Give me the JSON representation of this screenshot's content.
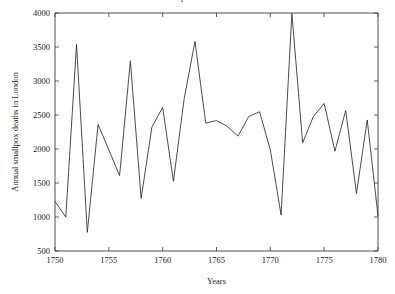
{
  "figure": {
    "title_clipped": "Annual smallpox deaths in London",
    "background": "#ffffff",
    "line_color": "#2b2b2b",
    "axis_color": "#3a3a3a"
  },
  "chart_data": {
    "type": "line",
    "title": "",
    "xlabel": "Years",
    "ylabel": "Annual smallpox deaths in London",
    "xlim": [
      1750,
      1780
    ],
    "ylim": [
      500,
      4000
    ],
    "xticks": [
      1750,
      1755,
      1760,
      1765,
      1770,
      1775,
      1780
    ],
    "xticklabels": [
      "1750",
      "1755",
      "1760",
      "1765",
      "1770",
      "1775",
      "1780"
    ],
    "yticks": [
      500,
      1000,
      1500,
      2000,
      2500,
      3000,
      3500,
      4000
    ],
    "yticklabels": [
      "500",
      "1000",
      "1500",
      "2000",
      "2500",
      "3000",
      "3500",
      "4000"
    ],
    "grid": false,
    "legend": false,
    "legend_position": "none",
    "x": [
      1750,
      1751,
      1752,
      1753,
      1754,
      1755,
      1756,
      1757,
      1758,
      1759,
      1760,
      1761,
      1762,
      1763,
      1764,
      1765,
      1766,
      1767,
      1768,
      1769,
      1770,
      1771,
      1772,
      1773,
      1774,
      1775,
      1776,
      1777,
      1778,
      1779,
      1780
    ],
    "values": [
      1229,
      998,
      3538,
      774,
      2360,
      1988,
      1608,
      3296,
      1273,
      2322,
      2612,
      1525,
      2743,
      3582,
      2382,
      2418,
      2334,
      2189,
      2479,
      2548,
      1986,
      1028,
      3992,
      2091,
      2479,
      2669,
      1968,
      2567,
      1346,
      2427,
      1015
    ],
    "series": [
      {
        "name": "Smallpox deaths",
        "values": [
          1229,
          998,
          3538,
          774,
          2360,
          1988,
          1608,
          3296,
          1273,
          2322,
          2612,
          1525,
          2743,
          3582,
          2382,
          2418,
          2334,
          2189,
          2479,
          2548,
          1986,
          1028,
          3992,
          2091,
          2479,
          2669,
          1968,
          2567,
          1346,
          2427,
          1015
        ]
      }
    ],
    "annotations": []
  }
}
